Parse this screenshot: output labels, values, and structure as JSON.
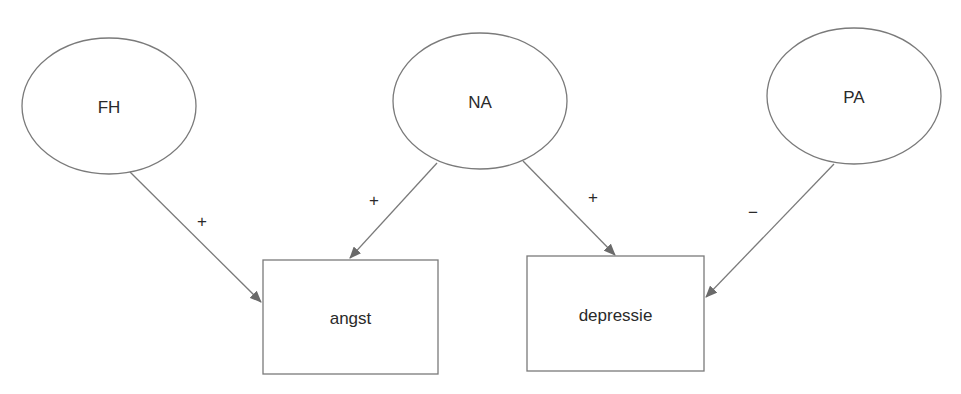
{
  "diagram": {
    "colors": {
      "stroke": "#7a7a7a",
      "arrow": "#6a6a6a",
      "text": "#2a2a2a",
      "background": "#ffffff"
    },
    "latent_nodes": [
      {
        "id": "FH",
        "label": "FH",
        "shape": "ellipse",
        "cx": 109,
        "cy": 106,
        "rx": 87,
        "ry": 68
      },
      {
        "id": "NA",
        "label": "NA",
        "shape": "ellipse",
        "cx": 480,
        "cy": 101,
        "rx": 87,
        "ry": 68
      },
      {
        "id": "PA",
        "label": "PA",
        "shape": "ellipse",
        "cx": 854,
        "cy": 96,
        "rx": 87,
        "ry": 68
      }
    ],
    "outcome_nodes": [
      {
        "id": "angst",
        "label": "angst",
        "shape": "rect",
        "x": 263,
        "y": 260,
        "w": 175,
        "h": 114
      },
      {
        "id": "depressie",
        "label": "depressie",
        "shape": "rect",
        "x": 527,
        "y": 256,
        "w": 177,
        "h": 115
      }
    ],
    "edges": [
      {
        "from": "FH",
        "to": "angst",
        "sign": "+",
        "x1": 130,
        "y1": 172,
        "x2": 261,
        "y2": 302,
        "label_x": 202,
        "label_y": 222
      },
      {
        "from": "NA",
        "to": "angst",
        "sign": "+",
        "x1": 437,
        "y1": 163,
        "x2": 350,
        "y2": 258,
        "label_x": 374,
        "label_y": 201
      },
      {
        "from": "NA",
        "to": "depressie",
        "sign": "+",
        "x1": 523,
        "y1": 161,
        "x2": 615,
        "y2": 255,
        "label_x": 593,
        "label_y": 198
      },
      {
        "from": "PA",
        "to": "depressie",
        "sign": "−",
        "x1": 834,
        "y1": 164,
        "x2": 706,
        "y2": 297,
        "label_x": 753,
        "label_y": 213
      }
    ]
  }
}
